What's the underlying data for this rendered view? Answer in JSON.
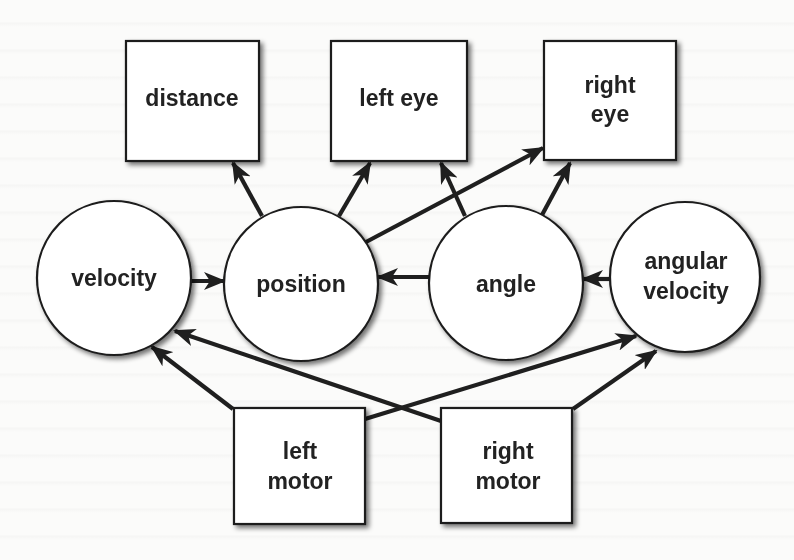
{
  "diagram": {
    "type": "causal-graph",
    "colors": {
      "background": "#fbfbfa",
      "stroke": "#1c1c1c",
      "node_fill": "#ffffff",
      "text": "#222222",
      "shadow": "#9a9a9a"
    },
    "nodes": {
      "distance": {
        "label_lines": [
          "distance"
        ],
        "shape": "box"
      },
      "left_eye": {
        "label_lines": [
          "left eye"
        ],
        "shape": "box"
      },
      "right_eye": {
        "label_lines": [
          "right",
          "eye"
        ],
        "shape": "box"
      },
      "velocity": {
        "label_lines": [
          "velocity"
        ],
        "shape": "circle"
      },
      "position": {
        "label_lines": [
          "position"
        ],
        "shape": "circle"
      },
      "angle": {
        "label_lines": [
          "angle"
        ],
        "shape": "circle"
      },
      "angular_velocity": {
        "label_lines": [
          "angular",
          "velocity"
        ],
        "shape": "circle"
      },
      "left_motor": {
        "label_lines": [
          "left",
          "motor"
        ],
        "shape": "box"
      },
      "right_motor": {
        "label_lines": [
          "right",
          "motor"
        ],
        "shape": "box"
      }
    },
    "edges": [
      {
        "from": "position",
        "to": "distance"
      },
      {
        "from": "position",
        "to": "left_eye"
      },
      {
        "from": "position",
        "to": "right_eye"
      },
      {
        "from": "angle",
        "to": "left_eye"
      },
      {
        "from": "angle",
        "to": "right_eye"
      },
      {
        "from": "velocity",
        "to": "position"
      },
      {
        "from": "angle",
        "to": "position"
      },
      {
        "from": "angular_velocity",
        "to": "angle"
      },
      {
        "from": "left_motor",
        "to": "velocity"
      },
      {
        "from": "left_motor",
        "to": "angular_velocity"
      },
      {
        "from": "right_motor",
        "to": "velocity"
      },
      {
        "from": "right_motor",
        "to": "angular_velocity"
      }
    ]
  }
}
